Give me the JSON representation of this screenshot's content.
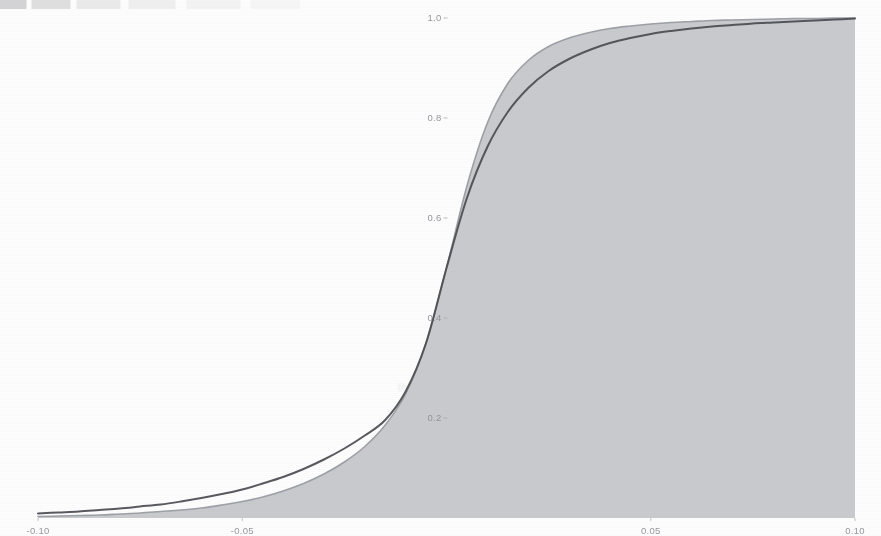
{
  "figure": {
    "kind": "scanned-figure",
    "background_color": "#fdfdfd"
  },
  "colors": {
    "dark_curve": "#4b4d52",
    "light_curve": "#9a9da3",
    "shaded_area": "#c6c8cc",
    "axis": "#a9abb0",
    "tick_text": "#8e9096"
  },
  "ghost_text": {
    "line1": "the scanned page reverse bleed-through",
    "line2": "faint illegible text"
  },
  "chart_data": {
    "type": "line",
    "title": "",
    "subtitle": "",
    "xlabel": "",
    "ylabel": "",
    "xlim": [
      -0.1,
      0.1
    ],
    "ylim": [
      0.0,
      1.0
    ],
    "grid": false,
    "legend": "none",
    "x_ticks": [
      -0.1,
      -0.05,
      0.0,
      0.05,
      0.1
    ],
    "x_tick_labels": [
      "-0.10",
      "-0.05",
      "",
      "0.05",
      "0.10"
    ],
    "y_ticks": [
      0.2,
      0.4,
      0.6,
      0.8,
      1.0
    ],
    "y_tick_labels": [
      "0.2",
      "0.4",
      "0.6",
      "0.8",
      "1.0"
    ],
    "axis_origin": {
      "x": 0.0,
      "y": 0.0
    },
    "vertical_axis_at_x": 0.0,
    "fill": {
      "series": "light",
      "to": 0.0,
      "color": "#c6c8cc",
      "label": "area under lighter curve"
    },
    "x": [
      -0.1,
      -0.095,
      -0.09,
      -0.085,
      -0.08,
      -0.075,
      -0.07,
      -0.065,
      -0.06,
      -0.055,
      -0.05,
      -0.045,
      -0.04,
      -0.035,
      -0.03,
      -0.025,
      -0.02,
      -0.015,
      -0.01,
      -0.005,
      0.0,
      0.005,
      0.01,
      0.015,
      0.02,
      0.025,
      0.03,
      0.035,
      0.04,
      0.045,
      0.05,
      0.055,
      0.06,
      0.065,
      0.07,
      0.075,
      0.08,
      0.085,
      0.09,
      0.095,
      0.1
    ],
    "series": [
      {
        "name": "dark",
        "style": "solid",
        "color": "#4b4d52",
        "width": 2.0,
        "values": [
          0.009,
          0.011,
          0.013,
          0.016,
          0.019,
          0.023,
          0.027,
          0.033,
          0.04,
          0.048,
          0.057,
          0.069,
          0.082,
          0.098,
          0.117,
          0.139,
          0.165,
          0.196,
          0.253,
          0.35,
          0.5,
          0.64,
          0.742,
          0.812,
          0.86,
          0.894,
          0.918,
          0.936,
          0.95,
          0.96,
          0.968,
          0.974,
          0.979,
          0.983,
          0.986,
          0.989,
          0.991,
          0.993,
          0.995,
          0.997,
          0.999
        ]
      },
      {
        "name": "light",
        "style": "solid",
        "color": "#9a9da3",
        "width": 1.6,
        "values": [
          0.003,
          0.004,
          0.005,
          0.006,
          0.008,
          0.01,
          0.013,
          0.016,
          0.02,
          0.026,
          0.033,
          0.042,
          0.054,
          0.069,
          0.088,
          0.112,
          0.143,
          0.186,
          0.248,
          0.35,
          0.5,
          0.664,
          0.79,
          0.869,
          0.915,
          0.943,
          0.96,
          0.971,
          0.979,
          0.984,
          0.988,
          0.991,
          0.993,
          0.995,
          0.996,
          0.997,
          0.998,
          0.999,
          0.999,
          1.0,
          1.0
        ]
      }
    ],
    "annotations": [
      {
        "text": "curves intersect",
        "x": 0.0,
        "y": 0.5
      }
    ]
  }
}
